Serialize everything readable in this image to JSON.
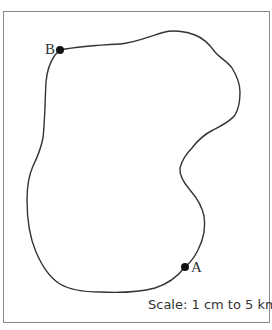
{
  "diagram": {
    "type": "map-outline",
    "points": [
      {
        "label": "B",
        "x": 60,
        "y": 50
      },
      {
        "label": "A",
        "x": 185,
        "y": 267
      }
    ],
    "scale_text": "Scale: 1 cm to 5 km",
    "colors": {
      "line": "#333333",
      "border": "#8a8a8a",
      "background": "#ffffff"
    }
  }
}
